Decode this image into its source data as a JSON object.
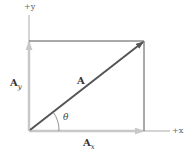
{
  "diagram": {
    "axes": {
      "x_label": "+x",
      "y_label": "+y"
    },
    "vectors": {
      "resultant": {
        "label": "A",
        "color": "#555555"
      },
      "x_component": {
        "label": "A",
        "subscript": "x",
        "color": "#c8c8c8"
      },
      "y_component": {
        "label": "A",
        "subscript": "y",
        "color": "#c8c8c8"
      }
    },
    "angle_label": "θ",
    "colors": {
      "axis": "#aaaaaa",
      "rectangle": "#555555",
      "resultant": "#555555",
      "components": "#c8c8c8"
    }
  }
}
